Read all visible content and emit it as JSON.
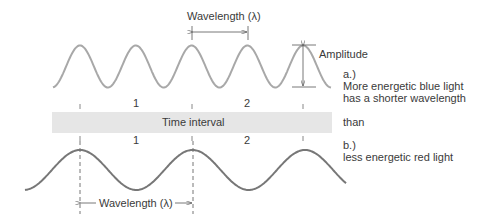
{
  "diagram": {
    "top_wave": {
      "name": "blue light wave",
      "cycles_shown": 5,
      "wavelength_label": "Wavelength (λ)",
      "amplitude_label": "Amplitude",
      "color": "#a8a8a8"
    },
    "bottom_wave": {
      "name": "red light wave",
      "cycles_shown": 2.5,
      "wavelength_label": "Wavelength (λ)",
      "color": "#777777"
    },
    "time_band": {
      "label": "Time interval",
      "color": "#e6e6e6",
      "top_markers": [
        "1",
        "2"
      ],
      "bottom_markers": [
        "1",
        "2"
      ]
    },
    "captions": {
      "a_label": "a.)",
      "a_line1": "More energetic blue light",
      "a_line2": "has a shorter wavelength",
      "connector": "than",
      "b_label": "b.)",
      "b_line1": "less energetic red light"
    }
  }
}
